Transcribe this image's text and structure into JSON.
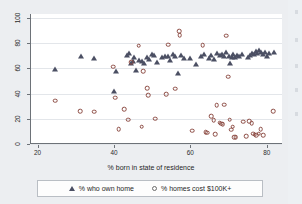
{
  "chart_data": {
    "type": "scatter",
    "title": "",
    "xlabel": "% born in state of residence",
    "ylabel": "",
    "xlim": [
      18,
      84
    ],
    "ylim": [
      0,
      103
    ],
    "xticks": [
      20,
      40,
      60,
      80
    ],
    "yticks": [
      0,
      20,
      40,
      60,
      80,
      100
    ],
    "grid": true,
    "legend_position": "bottom",
    "series": [
      {
        "name": "% who own home",
        "marker": "triangle",
        "color": "#4b4f63",
        "points": [
          [
            24.2,
            59.8
          ],
          [
            31.0,
            69.6
          ],
          [
            34.6,
            68.2
          ],
          [
            39.8,
            42.3
          ],
          [
            40.3,
            57.5
          ],
          [
            43.1,
            70.8
          ],
          [
            43.6,
            72.1
          ],
          [
            44.3,
            64.2
          ],
          [
            44.6,
            66.0
          ],
          [
            45.0,
            68.6
          ],
          [
            45.6,
            59.0
          ],
          [
            46.3,
            66.5
          ],
          [
            47.1,
            65.4
          ],
          [
            47.6,
            64.0
          ],
          [
            48.3,
            69.0
          ],
          [
            49.0,
            67.4
          ],
          [
            49.6,
            71.0
          ],
          [
            50.3,
            70.2
          ],
          [
            51.0,
            65.0
          ],
          [
            52.2,
            68.6
          ],
          [
            53.0,
            69.4
          ],
          [
            53.8,
            70.0
          ],
          [
            54.4,
            66.6
          ],
          [
            55.2,
            71.2
          ],
          [
            55.8,
            69.8
          ],
          [
            56.4,
            55.9
          ],
          [
            57.3,
            70.6
          ],
          [
            58.2,
            68.2
          ],
          [
            59.6,
            67.8
          ],
          [
            61.2,
            63.6
          ],
          [
            62.4,
            69.6
          ],
          [
            63.4,
            71.1
          ],
          [
            64.6,
            68.4
          ],
          [
            65.2,
            70.2
          ],
          [
            66.0,
            67.0
          ],
          [
            66.8,
            72.4
          ],
          [
            67.4,
            70.8
          ],
          [
            68.0,
            71.6
          ],
          [
            68.6,
            69.4
          ],
          [
            69.2,
            72.8
          ],
          [
            69.8,
            70.0
          ],
          [
            70.1,
            63.8
          ],
          [
            70.6,
            69.2
          ],
          [
            71.0,
            71.4
          ],
          [
            71.4,
            68.8
          ],
          [
            72.0,
            70.6
          ],
          [
            72.6,
            69.8
          ],
          [
            73.2,
            71.0
          ],
          [
            74.8,
            69.2
          ],
          [
            75.4,
            70.4
          ],
          [
            75.9,
            72.2
          ],
          [
            76.4,
            71.0
          ],
          [
            76.9,
            73.6
          ],
          [
            77.3,
            72.0
          ],
          [
            77.8,
            74.2
          ],
          [
            78.2,
            72.6
          ],
          [
            78.7,
            71.2
          ],
          [
            79.2,
            73.0
          ],
          [
            79.8,
            69.8
          ],
          [
            80.4,
            71.8
          ],
          [
            81.6,
            72.6
          ]
        ]
      },
      {
        "name": "% homes cost $100K+",
        "marker": "circle",
        "color": "#8c4a42",
        "points": [
          [
            24.3,
            34.2
          ],
          [
            30.9,
            25.8
          ],
          [
            34.5,
            25.6
          ],
          [
            39.6,
            61.4
          ],
          [
            40.0,
            36.8
          ],
          [
            41.0,
            11.6
          ],
          [
            42.4,
            27.4
          ],
          [
            43.4,
            19.2
          ],
          [
            44.3,
            64.6
          ],
          [
            46.2,
            77.8
          ],
          [
            47.0,
            13.8
          ],
          [
            47.4,
            57.8
          ],
          [
            48.4,
            44.4
          ],
          [
            48.7,
            38.6
          ],
          [
            50.6,
            20.2
          ],
          [
            53.4,
            39.6
          ],
          [
            54.0,
            78.6
          ],
          [
            55.8,
            43.9
          ],
          [
            56.8,
            89.3
          ],
          [
            56.9,
            86.2
          ],
          [
            60.2,
            10.4
          ],
          [
            63.0,
            78.4
          ],
          [
            63.8,
            9.4
          ],
          [
            64.2,
            8.9
          ],
          [
            65.2,
            21.8
          ],
          [
            65.8,
            19.0
          ],
          [
            66.2,
            7.6
          ],
          [
            66.6,
            30.8
          ],
          [
            67.4,
            17.0
          ],
          [
            67.8,
            16.2
          ],
          [
            68.2,
            15.8
          ],
          [
            68.6,
            31.0
          ],
          [
            69.2,
            85.8
          ],
          [
            69.6,
            53.4
          ],
          [
            70.0,
            19.2
          ],
          [
            70.4,
            11.4
          ],
          [
            70.8,
            13.6
          ],
          [
            71.2,
            5.6
          ],
          [
            71.6,
            5.4
          ],
          [
            73.6,
            17.8
          ],
          [
            74.4,
            6.2
          ],
          [
            75.2,
            18.2
          ],
          [
            75.8,
            16.4
          ],
          [
            76.2,
            8.2
          ],
          [
            76.6,
            7.4
          ],
          [
            77.0,
            6.8
          ],
          [
            77.6,
            8.0
          ],
          [
            78.2,
            11.6
          ],
          [
            78.8,
            7.2
          ],
          [
            81.4,
            25.8
          ]
        ]
      }
    ]
  },
  "axis": {
    "x_title": "% born in state of residence",
    "x_tick_labels": [
      "20",
      "40",
      "60",
      "80"
    ],
    "y_tick_labels": [
      "0",
      "20",
      "40",
      "60",
      "80",
      "100"
    ]
  },
  "legend": {
    "own_home_label": "% who own home",
    "homes_cost_label": "% homes cost $100K+"
  },
  "colors": {
    "triangle": "#4b4f63",
    "circle": "#8c4a42",
    "plot_background": "#ffffff",
    "figure_background": "#eceef1",
    "axis_line": "#6d7278",
    "grid": "#e3e6ea"
  }
}
